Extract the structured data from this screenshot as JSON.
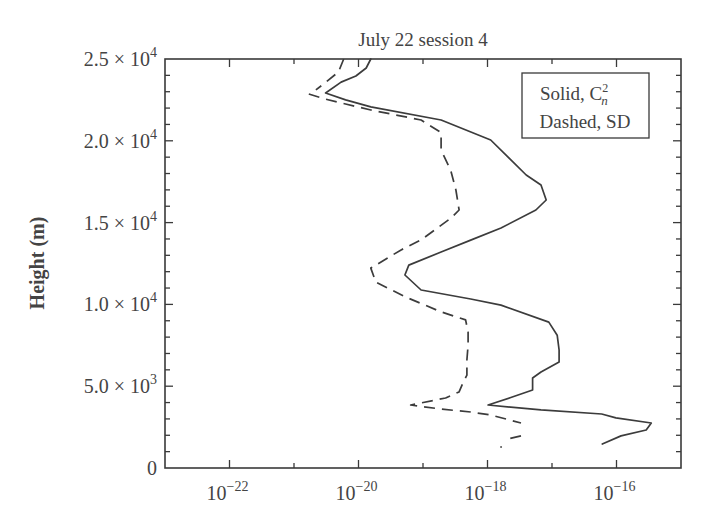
{
  "chart_data": {
    "type": "line",
    "title": "July 22 session 4",
    "xlabel": "",
    "ylabel": "Height (m)",
    "xscale": "log",
    "xlim_log10": [
      -23,
      -15
    ],
    "ylim": [
      0,
      25000
    ],
    "x_ticks": [
      {
        "exp": -22,
        "base": "10",
        "sup": "−22"
      },
      {
        "exp": -20,
        "base": "10",
        "sup": "−20"
      },
      {
        "exp": -18,
        "base": "10",
        "sup": "−18"
      },
      {
        "exp": -16,
        "base": "10",
        "sup": "−16"
      }
    ],
    "y_ticks": [
      {
        "value": 0,
        "label": "0",
        "sup": ""
      },
      {
        "value": 5000,
        "label": "5.0 × 10",
        "sup": "3"
      },
      {
        "value": 10000,
        "label": "1.0 × 10",
        "sup": "4"
      },
      {
        "value": 15000,
        "label": "1.5 × 10",
        "sup": "4"
      },
      {
        "value": 20000,
        "label": "2.0 × 10",
        "sup": "4"
      },
      {
        "value": 25000,
        "label": "2.5 × 10",
        "sup": "4"
      }
    ],
    "grid": false,
    "legend": {
      "position": "upper right",
      "entries": [
        {
          "style": "solid",
          "label": "Solid, C",
          "sub": "n",
          "sup": "2"
        },
        {
          "style": "dashed",
          "label": "Dashed, SD"
        }
      ]
    },
    "series": [
      {
        "name": "Cn2 (solid)",
        "style": "solid",
        "points": [
          {
            "log10_x": -19.81,
            "height": 25000
          },
          {
            "log10_x": -19.88,
            "height": 24450
          },
          {
            "log10_x": -20.04,
            "height": 23960
          },
          {
            "log10_x": -20.27,
            "height": 23590
          },
          {
            "log10_x": -20.51,
            "height": 22920
          },
          {
            "log10_x": -20.2,
            "height": 22500
          },
          {
            "log10_x": -19.81,
            "height": 22070
          },
          {
            "log10_x": -18.72,
            "height": 21270
          },
          {
            "log10_x": -17.95,
            "height": 20050
          },
          {
            "log10_x": -17.68,
            "height": 19000
          },
          {
            "log10_x": -17.4,
            "height": 17910
          },
          {
            "log10_x": -17.17,
            "height": 17300
          },
          {
            "log10_x": -17.09,
            "height": 16380
          },
          {
            "log10_x": -17.25,
            "height": 15770
          },
          {
            "log10_x": -17.79,
            "height": 14670
          },
          {
            "log10_x": -18.26,
            "height": 13930
          },
          {
            "log10_x": -18.72,
            "height": 13200
          },
          {
            "log10_x": -19.22,
            "height": 12400
          },
          {
            "log10_x": -19.28,
            "height": 11800
          },
          {
            "log10_x": -19.03,
            "height": 10880
          },
          {
            "log10_x": -18.26,
            "height": 10330
          },
          {
            "log10_x": -17.79,
            "height": 9960
          },
          {
            "log10_x": -17.05,
            "height": 8920
          },
          {
            "log10_x": -16.92,
            "height": 8120
          },
          {
            "log10_x": -16.89,
            "height": 7210
          },
          {
            "log10_x": -16.89,
            "height": 6480
          },
          {
            "log10_x": -17.17,
            "height": 5870
          },
          {
            "log10_x": -17.3,
            "height": 5500
          },
          {
            "log10_x": -17.3,
            "height": 4770
          },
          {
            "log10_x": -17.65,
            "height": 4290
          },
          {
            "log10_x": -17.99,
            "height": 3850
          },
          {
            "log10_x": -17.17,
            "height": 3550
          },
          {
            "log10_x": -16.23,
            "height": 3300
          },
          {
            "log10_x": -16.01,
            "height": 3060
          },
          {
            "log10_x": -15.46,
            "height": 2750
          },
          {
            "log10_x": -15.54,
            "height": 2320
          },
          {
            "log10_x": -15.93,
            "height": 1960
          },
          {
            "log10_x": -16.22,
            "height": 1470
          }
        ]
      },
      {
        "name": "SD (dashed)",
        "style": "dashed",
        "segments": [
          [
            {
              "log10_x": -20.23,
              "height": 25000
            },
            {
              "log10_x": -20.31,
              "height": 24210
            },
            {
              "log10_x": -20.5,
              "height": 23600
            },
            {
              "log10_x": -20.66,
              "height": 23110
            }
          ],
          [
            {
              "log10_x": -20.77,
              "height": 22860
            },
            {
              "log10_x": -20.51,
              "height": 22550
            },
            {
              "log10_x": -20.2,
              "height": 22250
            },
            {
              "log10_x": -19.81,
              "height": 21880
            },
            {
              "log10_x": -19.03,
              "height": 21270
            },
            {
              "log10_x": -18.72,
              "height": 20500
            },
            {
              "log10_x": -18.72,
              "height": 19440
            },
            {
              "log10_x": -18.57,
              "height": 18200
            },
            {
              "log10_x": -18.49,
              "height": 16990
            },
            {
              "log10_x": -18.44,
              "height": 15770
            },
            {
              "log10_x": -18.57,
              "height": 15260
            },
            {
              "log10_x": -19.03,
              "height": 13940
            },
            {
              "log10_x": -19.34,
              "height": 13330
            },
            {
              "log10_x": -19.81,
              "height": 12220
            },
            {
              "log10_x": -19.73,
              "height": 11360
            },
            {
              "log10_x": -19.27,
              "height": 10450
            },
            {
              "log10_x": -18.72,
              "height": 9540
            },
            {
              "log10_x": -18.34,
              "height": 9050
            },
            {
              "log10_x": -18.3,
              "height": 8310
            },
            {
              "log10_x": -18.3,
              "height": 7520
            },
            {
              "log10_x": -18.32,
              "height": 6600
            },
            {
              "log10_x": -18.32,
              "height": 5680
            },
            {
              "log10_x": -18.38,
              "height": 5200
            },
            {
              "log10_x": -18.44,
              "height": 4650
            },
            {
              "log10_x": -18.65,
              "height": 4280
            },
            {
              "log10_x": -19.19,
              "height": 3850
            },
            {
              "log10_x": -18.72,
              "height": 3600
            },
            {
              "log10_x": -18.26,
              "height": 3420
            },
            {
              "log10_x": -17.95,
              "height": 3240
            },
            {
              "log10_x": -17.48,
              "height": 2750
            }
          ],
          [
            {
              "log10_x": -17.48,
              "height": 1960
            },
            {
              "log10_x": -17.75,
              "height": 1710
            }
          ]
        ],
        "stray_points": [
          {
            "log10_x": -17.79,
            "height": 1280
          }
        ]
      }
    ]
  }
}
